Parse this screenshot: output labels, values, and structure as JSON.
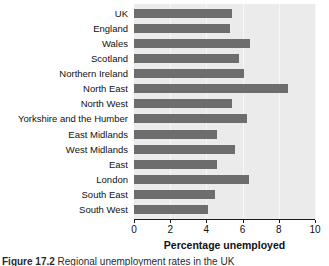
{
  "chart_data": {
    "type": "bar",
    "orientation": "horizontal",
    "title": "",
    "xlabel": "Percentage unemployed",
    "ylabel": "",
    "xlim": [
      0,
      10
    ],
    "xticks": [
      0,
      2,
      4,
      6,
      8,
      10
    ],
    "xtick_labels": [
      "0",
      "2",
      "4",
      "6",
      "8",
      "10"
    ],
    "grid": true,
    "legend": "none",
    "bar_color": "#6d6d6d",
    "plot_background": "#ebebeb",
    "categories": [
      "UK",
      "England",
      "Wales",
      "Scotland",
      "Northern Ireland",
      "North East",
      "North West",
      "Yorkshire and the Humber",
      "East Midlands",
      "West Midlands",
      "East",
      "London",
      "South East",
      "South West"
    ],
    "values": [
      5.4,
      5.3,
      6.4,
      5.8,
      6.1,
      8.5,
      5.4,
      6.25,
      4.6,
      5.6,
      4.6,
      6.35,
      4.5,
      4.1
    ],
    "series": [
      {
        "name": "Percentage unemployed",
        "values": [
          5.4,
          5.3,
          6.4,
          5.8,
          6.1,
          8.5,
          5.4,
          6.25,
          4.6,
          5.6,
          4.6,
          6.35,
          4.5,
          4.1
        ]
      }
    ]
  },
  "figure": {
    "caption_label": "Figure 17.2",
    "caption_text": " Regional unemployment rates in the UK"
  }
}
